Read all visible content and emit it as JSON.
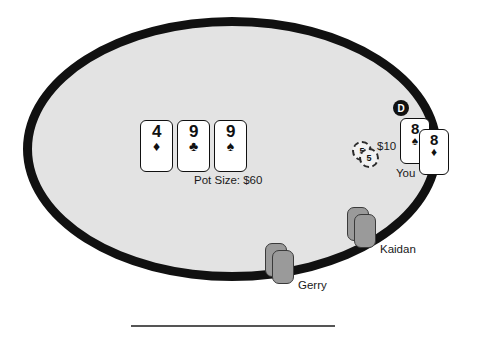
{
  "table": {
    "felt_color": "#e3e3e3",
    "rail_color": "#111111"
  },
  "pot": {
    "label": "Pot Size: $60",
    "amount": 60,
    "currency": "$"
  },
  "community_cards": [
    {
      "rank": "4",
      "suit_name": "diamond-suit-icon",
      "suit_glyph": "♦",
      "color": "#111111",
      "left": 140,
      "top": 120
    },
    {
      "rank": "9",
      "suit_name": "club-suit-icon",
      "suit_glyph": "♣",
      "color": "#111111",
      "left": 177,
      "top": 120
    },
    {
      "rank": "9",
      "suit_name": "spade-suit-icon",
      "suit_glyph": "♠",
      "color": "#111111",
      "left": 214,
      "top": 120
    }
  ],
  "dealer_button": {
    "label": "D",
    "name": "dealer-button-icon"
  },
  "hero": {
    "name_label": "You",
    "bet_label": "$10",
    "bet_amount": 10,
    "chips": [
      {
        "value": "5"
      },
      {
        "value": "5"
      }
    ],
    "cards": [
      {
        "rank": "8",
        "suit_name": "spade-suit-icon",
        "suit_glyph": "♠",
        "color": "#111111",
        "left": 400,
        "top": 118
      },
      {
        "rank": "8",
        "suit_name": "diamond-suit-icon",
        "suit_glyph": "♦",
        "color": "#111111",
        "left": 419,
        "top": 129
      }
    ]
  },
  "opponents": [
    {
      "name_label": "Gerry",
      "label_left": 298,
      "label_top": 279,
      "cards_facedown": [
        {
          "left": 265,
          "top": 243
        },
        {
          "left": 272,
          "top": 250
        }
      ]
    },
    {
      "name_label": "Kaidan",
      "label_left": 380,
      "label_top": 243,
      "cards_facedown": [
        {
          "left": 347,
          "top": 207
        },
        {
          "left": 354,
          "top": 214
        }
      ]
    }
  ],
  "divider": {
    "name": "bottom-divider"
  }
}
